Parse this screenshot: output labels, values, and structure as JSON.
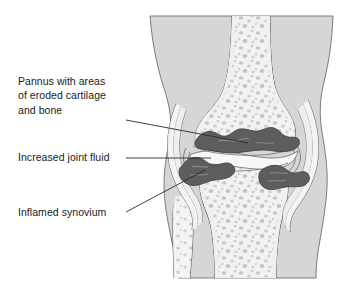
{
  "figure": {
    "background_color": "#ffffff",
    "view": "anterior coronal cross-section"
  },
  "labels": [
    {
      "id": "pannus",
      "name": "label-pannus",
      "text": "Pannus with areas\nof eroded cartilage\nand bone",
      "lines": [
        "Pannus with areas",
        "of eroded cartilage",
        "and bone"
      ],
      "leader_from": [
        126,
        120
      ],
      "leader_to": [
        248,
        143
      ]
    },
    {
      "id": "joint-fluid",
      "name": "label-increased-joint-fluid",
      "text": "Increased joint fluid",
      "lines": [
        "Increased joint fluid"
      ],
      "leader_from": [
        126,
        158
      ],
      "leader_to": [
        210,
        158
      ]
    },
    {
      "id": "synovium",
      "name": "label-inflamed-synovium",
      "text": "Inflamed synovium",
      "lines": [
        "Inflamed synovium"
      ],
      "leader_from": [
        126,
        212
      ],
      "leader_to": [
        204,
        171
      ]
    }
  ],
  "anatomy": {
    "soft_tissue": "Leg soft tissue silhouette",
    "femur": "Distal femur with trabecular bone",
    "tibia": "Proximal tibia with trabecular bone",
    "fibula": "Proximal fibula",
    "capsule": "Joint capsule and synovial membrane",
    "pannus_masses": "Inflammatory pannus eroding cartilage and bone",
    "joint_space": "Distended joint space with increased synovial fluid"
  },
  "colors": {
    "background": "#ffffff",
    "soft_tissue": "#d6d6d6",
    "bone_fill": "#efefef",
    "bone_cortex": "#e4e4e4",
    "trabecular_speckle": "#c2c2c2",
    "outline": "#555555",
    "outline_dark": "#3a3a3a",
    "pannus": "#5d5d5d",
    "pannus_outline": "#3c3c3c",
    "cartilage": "#f4f4f4",
    "capsule_band": "#f7f7f7",
    "leader_line": "#2a2a2a",
    "text": "#1a1a1a"
  }
}
